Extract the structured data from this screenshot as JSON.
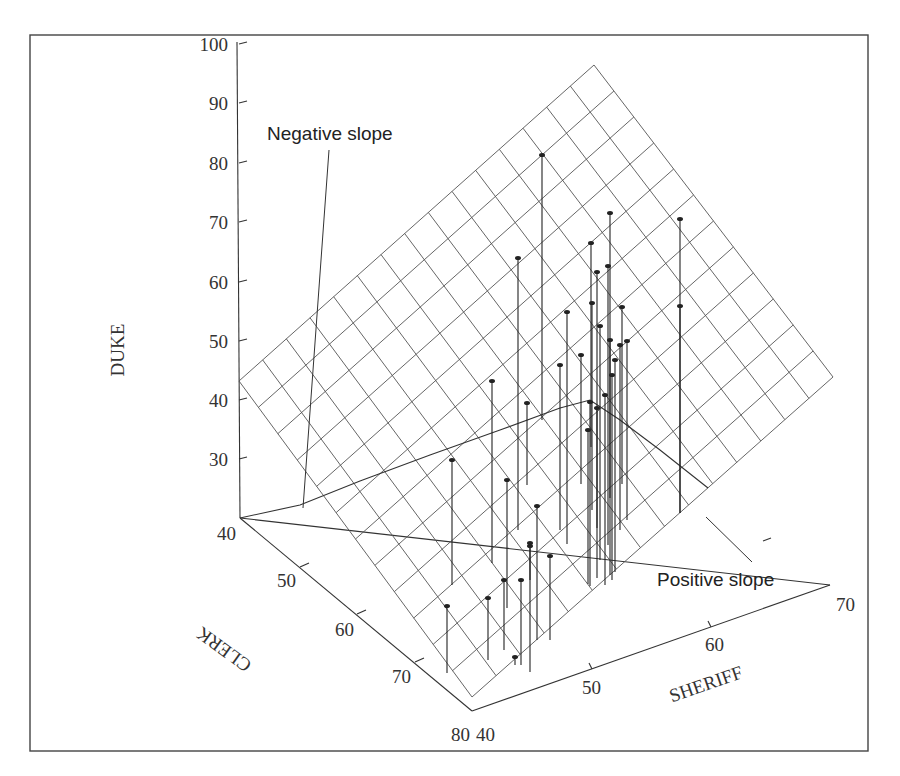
{
  "chart_data": {
    "type": "scatter",
    "subtype": "3d-scatter-with-regression-plane",
    "title": "",
    "axes": {
      "z": {
        "label": "DUKE",
        "ticks": [
          "100",
          "90",
          "80",
          "70",
          "60",
          "50",
          "40",
          "30"
        ],
        "range": [
          20,
          100
        ]
      },
      "x": {
        "label": "CLERK",
        "ticks": [
          "40",
          "50",
          "60",
          "70",
          "80"
        ],
        "range": [
          40,
          80
        ]
      },
      "y": {
        "label": "SHERIFF",
        "ticks": [
          "40",
          "50",
          "60",
          "70"
        ],
        "range": [
          40,
          70
        ]
      }
    },
    "annotations": [
      {
        "text": "Negative slope"
      },
      {
        "text": "Positive slope"
      }
    ],
    "plane": {
      "description": "Fitted regression plane drawn as a grid",
      "divisions": [
        15,
        12
      ]
    },
    "grid": false,
    "legend": null
  },
  "labels": {
    "z_title": "DUKE",
    "x_title": "CLERK",
    "y_title": "SHERIFF",
    "negative_slope": "Negative slope",
    "positive_slope": "Positive slope",
    "z_ticks": [
      {
        "text": "100",
        "x": 228,
        "y": 51
      },
      {
        "text": "90",
        "x": 228,
        "y": 110
      },
      {
        "text": "80",
        "x": 228,
        "y": 170
      },
      {
        "text": "70",
        "x": 228,
        "y": 229
      },
      {
        "text": "60",
        "x": 228,
        "y": 289
      },
      {
        "text": "50",
        "x": 228,
        "y": 348
      },
      {
        "text": "40",
        "x": 228,
        "y": 407
      },
      {
        "text": "30",
        "x": 228,
        "y": 466
      }
    ],
    "x_ticks": [
      {
        "text": "40",
        "x": 236,
        "y": 540
      },
      {
        "text": "50",
        "x": 296,
        "y": 587
      },
      {
        "text": "60",
        "x": 354,
        "y": 636
      },
      {
        "text": "70",
        "x": 411,
        "y": 683
      },
      {
        "text": "80",
        "x": 470,
        "y": 741
      }
    ],
    "y_ticks": [
      {
        "text": "40",
        "x": 476,
        "y": 741
      },
      {
        "text": "50",
        "x": 582,
        "y": 694
      },
      {
        "text": "60",
        "x": 705,
        "y": 651
      },
      {
        "text": "70",
        "x": 836,
        "y": 611
      }
    ]
  },
  "geometry": {
    "frame": {
      "x": 30,
      "y": 35,
      "w": 838,
      "h": 716
    },
    "plane": {
      "top": [
        594,
        65
      ],
      "right": [
        833,
        377
      ],
      "bottom": [
        472,
        697
      ],
      "left": [
        239,
        381
      ]
    },
    "z_axis": {
      "x": 239,
      "top": 42,
      "bottom": 518,
      "ticks_y": [
        44,
        103,
        163,
        222,
        282,
        341,
        400,
        459
      ]
    },
    "floor": {
      "origin": [
        240,
        518
      ],
      "clerk_end": [
        472,
        711
      ],
      "sheriff_end": [
        830,
        585
      ]
    },
    "clerk_ticks": [
      [
        300,
        567
      ],
      [
        357,
        614
      ],
      [
        415,
        662
      ]
    ],
    "sheriff_ticks": [
      [
        592,
        669
      ],
      [
        711,
        627
      ]
    ],
    "back_tick": [
      771,
      538
    ],
    "curve": [
      [
        240,
        518
      ],
      [
        300,
        505
      ],
      [
        360,
        481
      ],
      [
        430,
        455
      ],
      [
        500,
        430
      ],
      [
        560,
        408
      ],
      [
        590,
        400
      ],
      [
        620,
        420
      ],
      [
        660,
        450
      ],
      [
        708,
        488
      ]
    ],
    "neg_leader": [
      [
        329,
        150
      ],
      [
        303,
        508
      ]
    ],
    "pos_leader": [
      [
        706,
        517
      ],
      [
        752,
        562
      ]
    ],
    "stems": [
      [
        542,
        155,
        420
      ],
      [
        610,
        213,
        498
      ],
      [
        680,
        219,
        513
      ],
      [
        518,
        258,
        530
      ],
      [
        591,
        243,
        447
      ],
      [
        597,
        272,
        528
      ],
      [
        608,
        266,
        545
      ],
      [
        592,
        303,
        510
      ],
      [
        567,
        312,
        544
      ],
      [
        622,
        307,
        484
      ],
      [
        680,
        306,
        513
      ],
      [
        600,
        326,
        560
      ],
      [
        620,
        345,
        530
      ],
      [
        581,
        355,
        484
      ],
      [
        610,
        340,
        575
      ],
      [
        615,
        360,
        572
      ],
      [
        627,
        341,
        520
      ],
      [
        492,
        381,
        563
      ],
      [
        527,
        403,
        485
      ],
      [
        560,
        365,
        530
      ],
      [
        590,
        402,
        586
      ],
      [
        597,
        408,
        578
      ],
      [
        588,
        430,
        584
      ],
      [
        612,
        375,
        580
      ],
      [
        605,
        395,
        585
      ],
      [
        452,
        460,
        585
      ],
      [
        507,
        480,
        608
      ],
      [
        537,
        506,
        640
      ],
      [
        488,
        598,
        660
      ],
      [
        530,
        543,
        580
      ],
      [
        530,
        546,
        672
      ],
      [
        550,
        556,
        640
      ],
      [
        504,
        580,
        650
      ],
      [
        521,
        580,
        665
      ],
      [
        447,
        606,
        673
      ],
      [
        515,
        657,
        665
      ]
    ]
  }
}
